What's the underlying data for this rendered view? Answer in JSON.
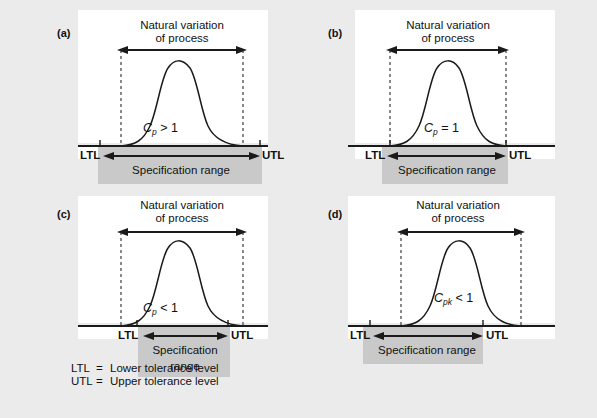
{
  "figure": {
    "background_color": "#ebebeb",
    "panel_color": "#ffffff",
    "spec_box_color": "#c9c9c9",
    "ink_color": "#1a1a1a"
  },
  "panels": [
    {
      "key": "a",
      "label": "(a)",
      "natural_variation_line1": "Natural variation",
      "natural_variation_line2": "of process",
      "capability_symbol": "C",
      "capability_subscript": "p",
      "capability_relation": "> 1",
      "capability_text": "Cp > 1",
      "ltl_label": "LTL",
      "utl_label": "UTL",
      "spec_range_line1": "Specification range",
      "spec_range_line2": "",
      "meaning": "Natural variation narrower than specification range"
    },
    {
      "key": "b",
      "label": "(b)",
      "natural_variation_line1": "Natural variation",
      "natural_variation_line2": "of process",
      "capability_symbol": "C",
      "capability_subscript": "p",
      "capability_relation": "= 1",
      "capability_text": "Cp = 1",
      "ltl_label": "LTL",
      "utl_label": "UTL",
      "spec_range_line1": "Specification range",
      "spec_range_line2": "",
      "meaning": "Natural variation equal to specification range"
    },
    {
      "key": "c",
      "label": "(c)",
      "natural_variation_line1": "Natural variation",
      "natural_variation_line2": "of process",
      "capability_symbol": "C",
      "capability_subscript": "p",
      "capability_relation": "< 1",
      "capability_text": "Cp < 1",
      "ltl_label": "LTL",
      "utl_label": "UTL",
      "spec_range_line1": "Specification",
      "spec_range_line2": "range",
      "meaning": "Natural variation wider than specification range"
    },
    {
      "key": "d",
      "label": "(d)",
      "natural_variation_line1": "Natural variation",
      "natural_variation_line2": "of process",
      "capability_symbol": "C",
      "capability_subscript": "pk",
      "capability_relation": "< 1",
      "capability_text": "Cpk < 1",
      "ltl_label": "LTL",
      "utl_label": "UTL",
      "spec_range_line1": "Specification range",
      "spec_range_line2": "",
      "meaning": "Process off-centre relative to specification range"
    }
  ],
  "legend": {
    "line1": "LTL =  Lower tolerance level",
    "line2": "UTL=  Upper tolerance level",
    "ltl_key": "LTL",
    "ltl_eq": "=",
    "ltl_text": "Lower tolerance level",
    "utl_key": "UTL",
    "utl_eq": "=",
    "utl_text": "Upper tolerance level"
  }
}
